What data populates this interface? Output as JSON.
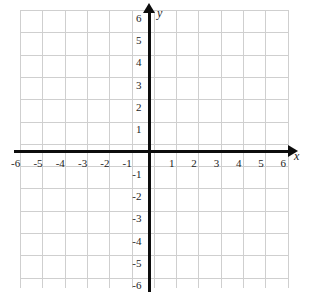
{
  "figure": {
    "kind": "cartesian-coordinate-grid",
    "background_color": "#ffffff",
    "grid_color": "#cfcfcf",
    "axis_color": "#0d0d0d",
    "label_color": "#1c1c1c"
  },
  "axes": {
    "x": {
      "name": "x",
      "min": -6,
      "max": 6,
      "step": 1,
      "tick_labels": [
        "-6",
        "-5",
        "-4",
        "-3",
        "-2",
        "-1",
        "1",
        "2",
        "3",
        "4",
        "5",
        "6"
      ],
      "arrow": "right"
    },
    "y": {
      "name": "y",
      "min": -6,
      "max": 6,
      "step": 1,
      "tick_labels": [
        "6",
        "5",
        "4",
        "3",
        "2",
        "1",
        "-1",
        "-2",
        "-3",
        "-4",
        "-5",
        "-6"
      ],
      "arrow": "up"
    }
  },
  "chart_data": {
    "type": "scatter",
    "title": "",
    "xlabel": "x",
    "ylabel": "y",
    "xlim": [
      -6,
      6
    ],
    "ylim": [
      -6,
      6
    ],
    "xticks": [
      -6,
      -5,
      -4,
      -3,
      -2,
      -1,
      1,
      2,
      3,
      4,
      5,
      6
    ],
    "yticks": [
      6,
      5,
      4,
      3,
      2,
      1,
      -1,
      -2,
      -3,
      -4,
      -5,
      -6
    ],
    "grid": true,
    "legend": null,
    "series": [],
    "annotations": []
  },
  "x_ticks": [
    {
      "label": "-6",
      "value": -6
    },
    {
      "label": "-5",
      "value": -5
    },
    {
      "label": "-4",
      "value": -4
    },
    {
      "label": "-3",
      "value": -3
    },
    {
      "label": "-2",
      "value": -2
    },
    {
      "label": "-1",
      "value": -1
    },
    {
      "label": "1",
      "value": 1
    },
    {
      "label": "2",
      "value": 2
    },
    {
      "label": "3",
      "value": 3
    },
    {
      "label": "4",
      "value": 4
    },
    {
      "label": "5",
      "value": 5
    },
    {
      "label": "6",
      "value": 6
    }
  ],
  "y_ticks": [
    {
      "label": "6",
      "value": 6
    },
    {
      "label": "5",
      "value": 5
    },
    {
      "label": "4",
      "value": 4
    },
    {
      "label": "3",
      "value": 3
    },
    {
      "label": "2",
      "value": 2
    },
    {
      "label": "1",
      "value": 1
    },
    {
      "label": "-1",
      "value": -1
    },
    {
      "label": "-2",
      "value": -2
    },
    {
      "label": "-3",
      "value": -3
    },
    {
      "label": "-4",
      "value": -4
    },
    {
      "label": "-5",
      "value": -5
    },
    {
      "label": "-6",
      "value": -6
    }
  ]
}
